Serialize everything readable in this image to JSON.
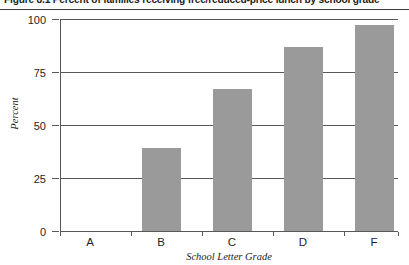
{
  "figure": {
    "title": "Figure 8.1 Percent of families receiving free/reduced-price lunch by school grade"
  },
  "chart_data": {
    "type": "bar",
    "title": "Figure 8.1 Percent of families receiving free/reduced-price lunch by school grade",
    "categories": [
      "A",
      "B",
      "C",
      "D",
      "F"
    ],
    "values": [
      0,
      39,
      67,
      87,
      97
    ],
    "xlabel": "School Letter Grade",
    "ylabel": "Percent",
    "ylim": [
      0,
      100
    ],
    "yticks": [
      0,
      25,
      50,
      75,
      100
    ],
    "ytick_labels": [
      "0",
      "25",
      "50",
      "75",
      "100"
    ],
    "grid": true,
    "legend": false,
    "bar_color": "#9a9a9a",
    "axis_color": "#58585a"
  }
}
